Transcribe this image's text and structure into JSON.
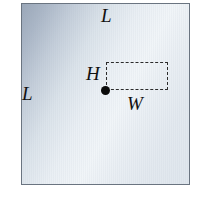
{
  "figure": {
    "type": "geometry-diagram",
    "outer_shape": {
      "name": "square",
      "side_label_top": "L",
      "side_label_left": "L",
      "border_color": "#6a7480",
      "fill_gradient_from": "#9aa7b8",
      "fill_gradient_to": "#f1f5f8"
    },
    "inner_shape": {
      "name": "dashed-rectangle",
      "width_label": "W",
      "height_label": "H",
      "stroke_color": "#2b2b2b",
      "stroke_style": "dashed"
    },
    "anchor_point": {
      "name": "corner-dot",
      "color": "#0b0b0b"
    }
  },
  "labels": {
    "l_top": "L",
    "l_left": "L",
    "h": "H",
    "w": "W"
  }
}
